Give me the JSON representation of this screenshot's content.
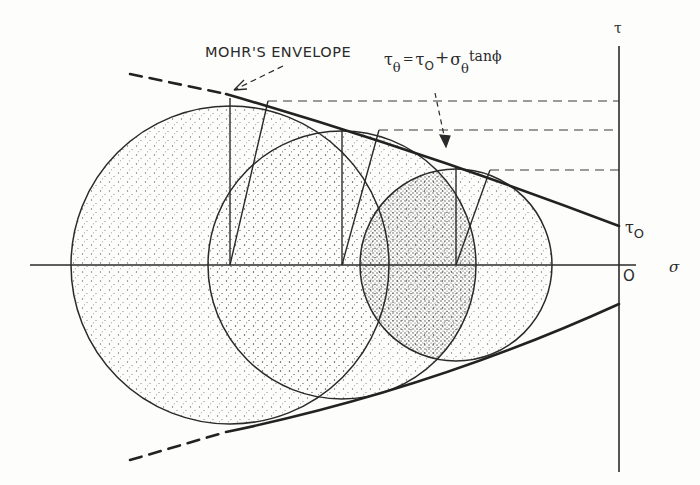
{
  "figure": {
    "title_label": "MOHR'S ENVELOPE",
    "equation": {
      "lhs": "τ",
      "lhs_sub": "θ",
      "eq": "=",
      "t0": "τ",
      "t0_sub": "O",
      "plus": "+",
      "sigma": "σ",
      "sigma_sub": "θ",
      "tail": "tanϕ"
    },
    "axes": {
      "x_label": "σ",
      "y_label": "τ",
      "origin_label": "O",
      "intercept_label": "τ",
      "intercept_sub": "O"
    },
    "colors": {
      "ink": "#2a2a2a",
      "paper": "#fdfdfc",
      "stipple": "#6a6a6a"
    }
  },
  "diagram_data": {
    "type": "mohr_circles",
    "circles": [
      {
        "cx": 230,
        "cy": 265,
        "r": 159,
        "tangent_x": 268,
        "tangent_y": 101
      },
      {
        "cx": 342,
        "cy": 265,
        "r": 134,
        "tangent_x": 379,
        "tangent_y": 130
      },
      {
        "cx": 456,
        "cy": 265,
        "r": 96,
        "tangent_x": 490,
        "tangent_y": 170
      }
    ],
    "envelope": {
      "upper_intercept_y": 226,
      "lower_intercept_y": 304,
      "cohesion_label": "τO"
    },
    "dashed_levels_y": [
      101,
      130,
      170
    ]
  }
}
